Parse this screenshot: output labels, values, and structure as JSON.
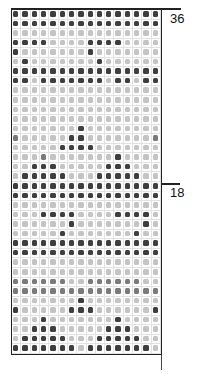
{
  "chart": {
    "columns": 16,
    "rows": 36,
    "row_labels": [
      {
        "label": "36",
        "row": 36
      },
      {
        "label": "18",
        "row": 18
      }
    ],
    "legend_levels": {
      "D": "dark",
      "M": "medium",
      "L": "light",
      "E": "very light"
    },
    "pattern_top_to_bottom": [
      "DDDDDDDDDDDDDDDD",
      "DDDDDDDDDDDDDDDD",
      "LLLLLLLLLLLLLLLL",
      "DDDDLLLLDDDDLLLL",
      "DLLLLLLLDLLLLLLL",
      "LDLLLLLLLDLLLLLL",
      "DDDDDDDDDDDDDDDD",
      "DDLDDDDDDDLDDLDD",
      "LLLLLLLLLLLLLLLL",
      "LLLLLLLLLLLLLLLL",
      "LLLLLLLLLLLLLLLL",
      "LLLLLLLLLLLLLLLL",
      "LLLLLLLDLLLLLLLL",
      "MLLLLLDDLLLLLLLM",
      "LLLLLDDDDLLLLLLL",
      "LLLMLLLLLLLDLLLL",
      "LLDDDLLLLLDDDLLL",
      "LDDDDDLLLDDDDDLL",
      "DDDDDDDDDDDDDDDD",
      "DDDDDDDDDDDDDDDD",
      "LLLLLLLLLLLLLLLL",
      "LLLDDDDLLLLDDDDL",
      "LLLLLLDLLLLLLLDL",
      "LLLLLDLLLLLLLDLL",
      "DDDDDDDDDDDDDDDD",
      "DDDDDDDDDDDDDDDD",
      "LLLLLLLLLLLLLLLL",
      "LLLLLLLLLLLLLLLL",
      "MMMMMMLLMMMMMMLL",
      "MMMMMMMMMMMMMMMM",
      "LLLLLLLDLLLLLLLL",
      "DLLLLLDDDLLLLLLD",
      "LLLDLLLLLLLDLLLL",
      "LLDDDLLLLLDDDLLL",
      "LDDDDDLLLDDDDDLL",
      "DDDDDDDLDDDDDDDL"
    ]
  }
}
